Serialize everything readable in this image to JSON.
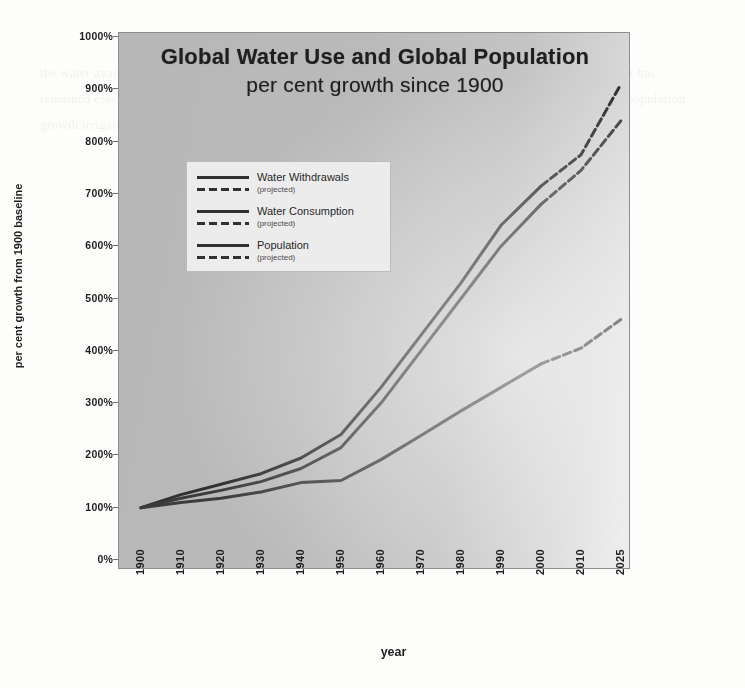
{
  "chart_data": {
    "type": "line",
    "title": "Global Water Use and Global Population",
    "subtitle": "per cent growth since 1900",
    "xlabel": "year",
    "ylabel": "per cent growth from 1900 baseline",
    "x": [
      1900,
      1910,
      1920,
      1930,
      1940,
      1950,
      1960,
      1970,
      1980,
      1990,
      2000,
      2010,
      2025
    ],
    "xtick_labels": [
      "1900",
      "1910",
      "1920",
      "1930",
      "1940",
      "1950",
      "1960",
      "1970",
      "1980",
      "1990",
      "2000",
      "2010",
      "2025"
    ],
    "ytick_labels": [
      "0%",
      "100%",
      "200%",
      "300%",
      "400%",
      "500%",
      "600%",
      "700%",
      "800%",
      "900%",
      "1000%"
    ],
    "ytick_values": [
      0,
      100,
      200,
      300,
      400,
      500,
      600,
      700,
      800,
      900,
      1000
    ],
    "ylim": [
      0,
      1000
    ],
    "xlim": [
      1900,
      2025
    ],
    "grid": false,
    "legend_position": "upper-left-inside",
    "projection_starts_at": 2000,
    "series": [
      {
        "name": "Water Withdrawals",
        "projected_name": "projected",
        "color": "#2e2e2e",
        "values": [
          100,
          125,
          145,
          165,
          195,
          240,
          330,
          430,
          530,
          640,
          715,
          775,
          910
        ]
      },
      {
        "name": "Water Consumption",
        "projected_name": "projected",
        "color": "#3a3a3a",
        "values": [
          100,
          118,
          133,
          150,
          175,
          215,
          300,
          400,
          500,
          600,
          680,
          745,
          840
        ]
      },
      {
        "name": "Population",
        "projected_name": "projected",
        "color": "#3a3a3a",
        "values": [
          100,
          110,
          118,
          130,
          148,
          152,
          192,
          238,
          285,
          330,
          375,
          405,
          460
        ]
      }
    ]
  },
  "axis": {
    "y_title": "per cent growth from 1900 baseline",
    "x_title": "year"
  },
  "legend": {
    "entries": [
      {
        "label": "Water Withdrawals",
        "sub": "(projected)"
      },
      {
        "label": "Water Consumption",
        "sub": "(projected)"
      },
      {
        "label": "Population",
        "sub": "(projected)"
      }
    ]
  },
  "colors": {
    "plot_background": "#bcbcbc",
    "line": "#2e2e2e",
    "legend_background": "#efefef",
    "page_background": "#fdfdfc",
    "text": "#1c1c1c"
  },
  "ghost_text": "the water available for human use is a small fraction of the total and the amount of fresh water on the planet has remained essentially constant while demand has multiplied many times over the past century as a result of population growth irrigated agriculture and industrial development"
}
